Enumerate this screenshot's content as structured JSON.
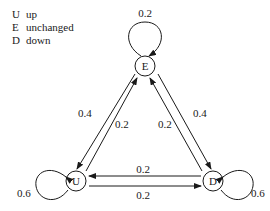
{
  "legend": [
    {
      "key": "U",
      "label": "up"
    },
    {
      "key": "E",
      "label": "unchanged"
    },
    {
      "key": "D",
      "label": "down"
    }
  ],
  "nodes": {
    "E": {
      "label": "E"
    },
    "U": {
      "label": "U"
    },
    "D": {
      "label": "D"
    }
  },
  "edges": {
    "E_E": "0.2",
    "U_U": "0.6",
    "D_D": "0.6",
    "E_U": "0.4",
    "U_E": "0.2",
    "D_E": "0.2",
    "E_D": "0.4",
    "D_U": "0.2",
    "U_D": "0.2"
  }
}
